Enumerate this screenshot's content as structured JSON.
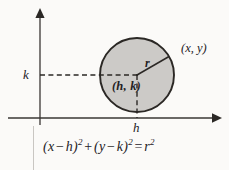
{
  "figure": {
    "background_color": "#fbfaf8",
    "ink_color": "#24211f",
    "circle_fill_color": "#cccac7",
    "circle_stroke_color": "#2b2825",
    "axes": {
      "x_axis_label": "",
      "y_axis_label": "",
      "x_tick_label": "h",
      "y_tick_label": "k",
      "x_axis_y_px": 118,
      "y_axis_x_px": 40,
      "arrowheads": [
        "up",
        "right"
      ]
    },
    "circle": {
      "center_label": "(h, k)",
      "point_label": "(x, y)",
      "radius_label": "r",
      "center_x_px": 137,
      "center_y_px": 75,
      "radius_px": 37
    },
    "equation": {
      "lhs_term1_open": "(",
      "lhs_term1_var": "x",
      "lhs_term1_op": "−",
      "lhs_term1_param": "h",
      "lhs_term1_close": ")",
      "lhs_term1_exp": "2",
      "plus": "+",
      "lhs_term2_open": "(",
      "lhs_term2_var": "y",
      "lhs_term2_op": "−",
      "lhs_term2_param": "k",
      "lhs_term2_close": ")",
      "lhs_term2_exp": "2",
      "equals": "=",
      "rhs_var": "r",
      "rhs_exp": "2",
      "full_text": "(x − h)² + (y − k)² = r²"
    }
  }
}
